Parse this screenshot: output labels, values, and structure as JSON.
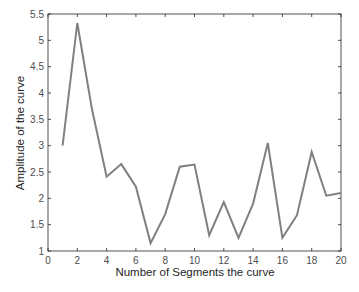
{
  "chart_data": {
    "type": "line",
    "title": "",
    "xlabel": "Number of Segments the curve",
    "ylabel": "Amplitude of the curve",
    "xlim": [
      0,
      20
    ],
    "ylim": [
      1,
      5.5
    ],
    "xticks": [
      0,
      2,
      4,
      6,
      8,
      10,
      12,
      14,
      16,
      18,
      20
    ],
    "yticks": [
      1,
      1.5,
      2,
      2.5,
      3,
      3.5,
      4,
      4.5,
      5,
      5.5
    ],
    "ytick_labels": [
      "1",
      "1.5",
      "2",
      "2.5",
      "3",
      "3.5",
      "4",
      "4.5",
      "5",
      "5.5"
    ],
    "grid": false,
    "legend": null,
    "line_color": "#808080",
    "axis_color": "#262626",
    "series": [
      {
        "name": "amplitude",
        "x": [
          1,
          2,
          3,
          4,
          5,
          6,
          7,
          8,
          9,
          10,
          11,
          12,
          13,
          14,
          15,
          16,
          17,
          18,
          19,
          20
        ],
        "values": [
          3.0,
          5.33,
          3.7,
          2.41,
          2.65,
          2.22,
          1.15,
          1.7,
          2.6,
          2.64,
          1.3,
          1.93,
          1.25,
          1.9,
          3.05,
          1.25,
          1.68,
          2.88,
          2.05,
          2.1
        ]
      }
    ]
  }
}
